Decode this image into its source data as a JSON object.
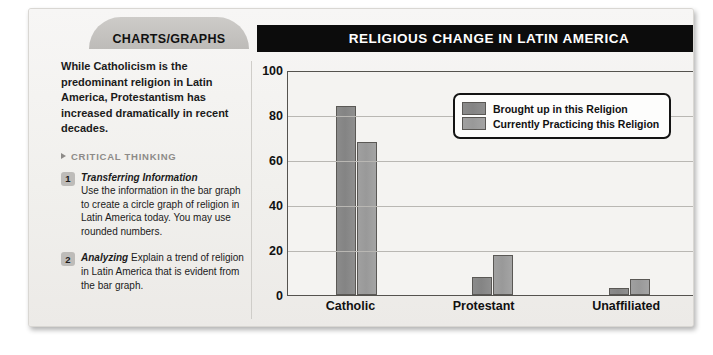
{
  "tab": {
    "label": "CHARTS/GRAPHS"
  },
  "header": {
    "title": "RELIGIOUS CHANGE IN LATIN AMERICA"
  },
  "sidebar": {
    "intro": "While Catholicism is the predominant religion in Latin America, Protestantism has increased dramatically in recent decades.",
    "section_label": "CRITICAL THINKING",
    "triangle_icon": "triangle-right-icon",
    "questions": [
      {
        "number": "1",
        "term": "Transferring Information",
        "text": "Use the information in the bar graph to create a circle graph of religion in Latin America today. You may use rounded numbers."
      },
      {
        "number": "2",
        "term": "Analyzing",
        "text": "Explain a trend of religion in Latin America that is evident from the bar graph."
      }
    ]
  },
  "chart_data": {
    "type": "bar",
    "title": "RELIGIOUS CHANGE IN LATIN AMERICA",
    "xlabel": "",
    "ylabel": "",
    "ylim": [
      0,
      100
    ],
    "yticks": [
      0,
      20,
      40,
      60,
      80,
      100
    ],
    "grid": true,
    "legend_position": "top-right",
    "categories": [
      "Catholic",
      "Protestant",
      "Unaffiliated"
    ],
    "series": [
      {
        "name": "Brought up in this Religion",
        "color": "#8b8b8b",
        "values": [
          84,
          8,
          3
        ]
      },
      {
        "name": "Currently Practicing this Religion",
        "color": "#a0a0a0",
        "values": [
          68,
          18,
          7
        ]
      }
    ]
  }
}
